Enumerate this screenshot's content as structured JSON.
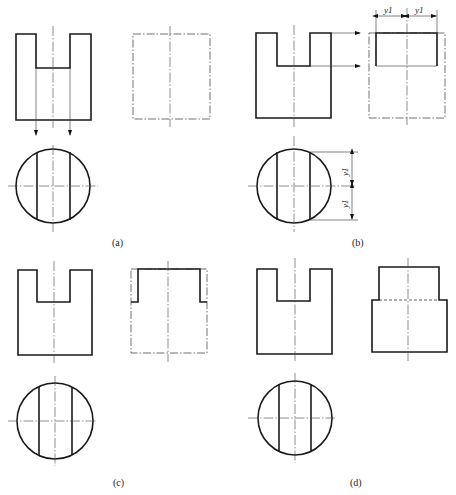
{
  "figure": {
    "panels": [
      {
        "id": "a",
        "label": "(a)",
        "description": "Front view with slot, projection arrows to top view circle, side view outline in phantom (dash-dot) lines"
      },
      {
        "id": "b",
        "label": "(b)",
        "description": "Slot depth transferred to side view with horizontal projection arrows; width measured as y1 from top view",
        "dimension_label": "y1"
      },
      {
        "id": "c",
        "label": "(c)",
        "description": "Side view upper part drawn solid; remaining outline still phantom"
      },
      {
        "id": "d",
        "label": "(d)",
        "description": "Completed side view with hidden line at slot bottom"
      }
    ],
    "dimension_text": "y1"
  }
}
